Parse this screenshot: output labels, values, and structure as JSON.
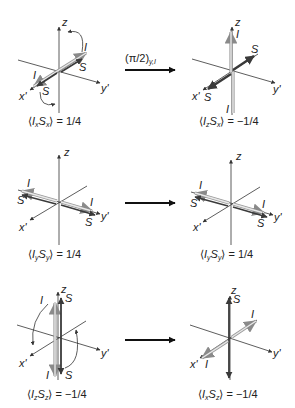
{
  "diagram": {
    "type": "spin-vector-rotation",
    "colors": {
      "axis": "#333333",
      "I_vector_outline": "#9a9a9a",
      "I_vector_fill": "#e2e2e2",
      "S_vector": "#3a3a3a",
      "arrow": "#111111",
      "background": "#ffffff"
    },
    "transform_label": {
      "prefix": "(π/2)",
      "subscript": "y,I"
    },
    "rows": [
      {
        "left": {
          "axes": {
            "z": "z",
            "x": "x'",
            "y": "y'"
          },
          "vector_labels": [
            "I",
            "S",
            "I",
            "S"
          ],
          "expectation": {
            "op1": "I",
            "sub1": "x",
            "op2": "S",
            "sub2": "x",
            "value": "= 1/4"
          }
        },
        "right": {
          "axes": {
            "z": "z",
            "x": "x'",
            "y": "y'"
          },
          "vector_labels": [
            "I",
            "S",
            "S",
            "I"
          ],
          "expectation": {
            "op1": "I",
            "sub1": "z",
            "op2": "S",
            "sub2": "x",
            "value": "= −1/4"
          }
        }
      },
      {
        "left": {
          "axes": {
            "z": "z",
            "x": "x'",
            "y": "y'"
          },
          "vector_labels": [
            "I",
            "S",
            "I",
            "S"
          ],
          "expectation": {
            "op1": "I",
            "sub1": "y",
            "op2": "S",
            "sub2": "y",
            "value": "= 1/4"
          }
        },
        "right": {
          "axes": {
            "z": "z",
            "x": "x'",
            "y": "y'"
          },
          "vector_labels": [
            "I",
            "S",
            "I",
            "S"
          ],
          "expectation": {
            "op1": "I",
            "sub1": "y",
            "op2": "S",
            "sub2": "y",
            "value": "= 1/4"
          }
        }
      },
      {
        "left": {
          "axes": {
            "z": "z",
            "x": "x'",
            "y": "y'"
          },
          "vector_labels": [
            "I",
            "S",
            "I",
            "S"
          ],
          "expectation": {
            "op1": "I",
            "sub1": "z",
            "op2": "S",
            "sub2": "z",
            "value": "= −1/4"
          }
        },
        "right": {
          "axes": {
            "z": "z",
            "x": "x'",
            "y": "y'"
          },
          "vector_labels": [
            "S",
            "I",
            "I"
          ],
          "expectation": {
            "op1": "I",
            "sub1": "x",
            "op2": "S",
            "sub2": "z",
            "value": "= −1/4"
          }
        }
      }
    ]
  }
}
